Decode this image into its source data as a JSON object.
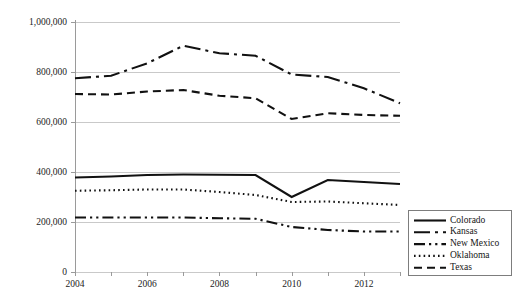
{
  "chart_data": {
    "type": "line",
    "title": "",
    "subtitle": "",
    "xlabel": "",
    "ylabel": "",
    "x": [
      2004,
      2005,
      2006,
      2007,
      2008,
      2009,
      2010,
      2011,
      2012,
      2013
    ],
    "xlim": [
      2004,
      2013
    ],
    "ylim": [
      0,
      1000000
    ],
    "grid": true,
    "grid_axis": "y",
    "legend_position": "right-bottom-outside",
    "y_ticks": [
      0,
      200000,
      400000,
      600000,
      800000,
      1000000
    ],
    "y_tick_labels": [
      "0",
      "200,000",
      "400,000",
      "600,000",
      "800,000",
      "1,000,000"
    ],
    "x_ticks": [
      2004,
      2005,
      2006,
      2007,
      2008,
      2009,
      2010,
      2011,
      2012,
      2013
    ],
    "x_tick_labels": [
      "2004",
      "",
      "2006",
      "",
      "2008",
      "",
      "2010",
      "",
      "2012",
      ""
    ],
    "x_visible_tick_labels": [
      "2004",
      "2006",
      "2008",
      "2010",
      "2012"
    ],
    "series": [
      {
        "name": "Colorado",
        "dash": "solid",
        "color": "#111111",
        "values": [
          378000,
          382000,
          388000,
          390000,
          389000,
          388000,
          300000,
          368000,
          360000,
          352000
        ]
      },
      {
        "name": "Kansas",
        "dash": "long-dash-dot",
        "color": "#111111",
        "values": [
          775000,
          785000,
          835000,
          905000,
          875000,
          865000,
          790000,
          780000,
          735000,
          675000
        ]
      },
      {
        "name": "New Mexico",
        "dash": "dash-dot-dot",
        "color": "#111111",
        "values": [
          218000,
          218000,
          218000,
          218000,
          215000,
          213000,
          180000,
          168000,
          162000,
          162000
        ]
      },
      {
        "name": "Oklahoma",
        "dash": "dotted",
        "color": "#111111",
        "values": [
          325000,
          327000,
          330000,
          330000,
          320000,
          308000,
          280000,
          282000,
          275000,
          268000
        ]
      },
      {
        "name": "Texas",
        "dash": "dashed",
        "color": "#111111",
        "values": [
          712000,
          710000,
          722000,
          728000,
          705000,
          695000,
          612000,
          635000,
          628000,
          625000
        ]
      }
    ]
  },
  "legend": {
    "items": [
      {
        "label": "Colorado"
      },
      {
        "label": "Kansas"
      },
      {
        "label": "New Mexico"
      },
      {
        "label": "Oklahoma"
      },
      {
        "label": "Texas"
      }
    ]
  },
  "axes": {
    "y_labels": [
      "1,000,000",
      "800,000",
      "600,000",
      "400,000",
      "200,000",
      "0"
    ],
    "x_labels": [
      "2004",
      "2006",
      "2008",
      "2010",
      "2012"
    ]
  },
  "colors": {
    "ink": "#111111",
    "grid": "#c9c9c9",
    "axis": "#9a9a9a",
    "background": "#ffffff"
  }
}
